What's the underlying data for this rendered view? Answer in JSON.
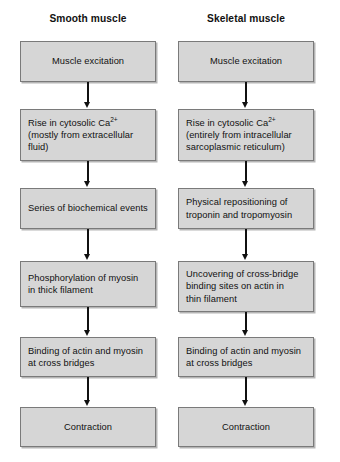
{
  "diagram": {
    "title_left": "Smooth muscle",
    "title_right": "Skeletal muscle",
    "columns": [
      {
        "id": "smooth-muscle",
        "header": "Smooth muscle",
        "nodes": [
          {
            "id": "muscle-excitation",
            "text": "Muscle excitation",
            "align": "center",
            "top": 41,
            "height": 41
          },
          {
            "id": "rise-in-cytosolic-ca",
            "text_html": "Rise in cytosolic Ca<sup>2+</sup><br>(mostly from extracellular<br>fluid)",
            "text": "Rise in cytosolic Ca2+ (mostly from extracellular fluid)",
            "align": "left",
            "top": 109,
            "height": 52
          },
          {
            "id": "series-of-biochemical-events",
            "text": "Series of biochemical events",
            "align": "left",
            "top": 188,
            "height": 41
          },
          {
            "id": "phosphorylation-of-myosin",
            "text_html": "Phosphorylation of myosin<br>in thick filament",
            "text": "Phosphorylation of myosin in thick filament",
            "align": "left",
            "top": 261,
            "height": 46
          },
          {
            "id": "binding-of-actin-and-myosin",
            "text_html": "Binding of actin and myosin<br>at cross bridges",
            "text": "Binding of actin and myosin at cross bridges",
            "align": "left",
            "top": 337,
            "height": 40
          },
          {
            "id": "contraction",
            "text": "Contraction",
            "align": "center",
            "top": 407,
            "height": 40
          }
        ],
        "arrows": [
          {
            "id": "arrow-1",
            "top": 82,
            "height": 26
          },
          {
            "id": "arrow-2",
            "top": 161,
            "height": 26
          },
          {
            "id": "arrow-3",
            "top": 229,
            "height": 31
          },
          {
            "id": "arrow-4",
            "top": 307,
            "height": 29
          },
          {
            "id": "arrow-5",
            "top": 377,
            "height": 29
          }
        ]
      },
      {
        "id": "skeletal-muscle",
        "header": "Skeletal muscle",
        "nodes": [
          {
            "id": "muscle-excitation",
            "text": "Muscle excitation",
            "align": "center",
            "top": 41,
            "height": 41
          },
          {
            "id": "rise-in-cytosolic-ca",
            "text_html": "Rise in cytosolic Ca<sup>2+</sup><br>(entirely from intracellular<br>sarcoplasmic reticulum)",
            "text": "Rise in cytosolic Ca2+ (entirely from intracellular sarcoplasmic reticulum)",
            "align": "left",
            "top": 109,
            "height": 52
          },
          {
            "id": "physical-repositioning-of-troponin",
            "text_html": "Physical repositioning of<br>troponin and tropomyosin",
            "text": "Physical repositioning of troponin and tropomyosin",
            "align": "left",
            "top": 188,
            "height": 41
          },
          {
            "id": "uncovering-of-cross-bridge-binding-sites",
            "text_html": "Uncovering of cross-bridge<br>binding sites on actin in<br>thin filament",
            "text": "Uncovering of cross-bridge binding sites on actin in thin filament",
            "align": "left",
            "top": 261,
            "height": 51
          },
          {
            "id": "binding-of-actin-and-myosin",
            "text_html": "Binding of actin and myosin<br>at cross bridges",
            "text": "Binding of actin and myosin at cross bridges",
            "align": "left",
            "top": 337,
            "height": 40
          },
          {
            "id": "contraction",
            "text": "Contraction",
            "align": "center",
            "top": 407,
            "height": 40
          }
        ],
        "arrows": [
          {
            "id": "arrow-1",
            "top": 82,
            "height": 26
          },
          {
            "id": "arrow-2",
            "top": 161,
            "height": 26
          },
          {
            "id": "arrow-3",
            "top": 229,
            "height": 31
          },
          {
            "id": "arrow-4",
            "top": 312,
            "height": 24
          },
          {
            "id": "arrow-5",
            "top": 377,
            "height": 29
          }
        ]
      }
    ],
    "colors": {
      "node_fill": "#d6d6d6",
      "node_border": "#7a7a7a",
      "arrow": "#111111",
      "text": "#111111",
      "background": "#ffffff"
    }
  }
}
